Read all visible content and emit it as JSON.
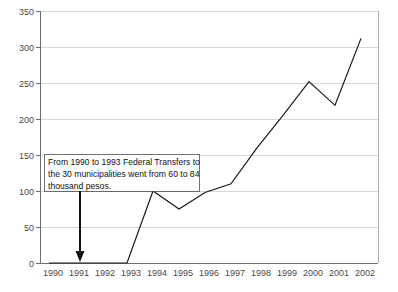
{
  "chart_data": {
    "type": "line",
    "title": "",
    "subtitle": "",
    "xlabel": "",
    "ylabel": "",
    "categories": [
      "1990",
      "1991",
      "1992",
      "1993",
      "1994",
      "1995",
      "1996",
      "1997",
      "1998",
      "1999",
      "2000",
      "2001",
      "2002"
    ],
    "values": [
      0,
      0,
      0,
      0,
      100,
      75,
      98,
      110,
      160,
      205,
      252,
      219,
      312
    ],
    "series": [
      {
        "name": "Federal Transfers",
        "values": [
          0,
          0,
          0,
          0,
          100,
          75,
          98,
          110,
          160,
          205,
          252,
          219,
          312
        ]
      }
    ],
    "ylim": [
      0,
      350
    ],
    "ytick_values": [
      0,
      50,
      100,
      150,
      200,
      250,
      300,
      350
    ],
    "ytick_labels": [
      "0",
      "50",
      "100",
      "150",
      "200",
      "250",
      "300",
      "350"
    ],
    "xtick_labels": [
      "1990",
      "1991",
      "1992",
      "1993",
      "1994",
      "1995",
      "1996",
      "1997",
      "1998",
      "1999",
      "2000",
      "2001",
      "2002"
    ],
    "grid": true,
    "grid_axis": "y",
    "legend": false,
    "legend_position": "none",
    "line_color": "#1a1a1a",
    "grid_color": "#c8c8c8",
    "axis_color": "#6f6f6f",
    "background_color": "#ffffff",
    "annotations": [
      {
        "name": "federal-transfers-note",
        "lines": [
          "From 1990 to 1993 Federal Transfers to",
          "the 30 municipalities went from 60 to 84",
          "thousand pesos."
        ],
        "text": "From 1990 to 1993 Federal Transfers to the 30 municipalities went from 60 to 84 thousand pesos.",
        "points_to_year": "1991",
        "points_to_value": 0,
        "arrow": "down-arrow"
      }
    ]
  }
}
